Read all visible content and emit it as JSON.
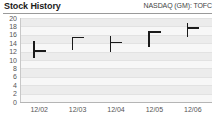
{
  "header": {
    "title": "Stock History",
    "ticker": "NASDAQ (GM): TOFC"
  },
  "chart_data": {
    "type": "ohlc",
    "title": "Stock History",
    "subtitle": "NASDAQ (GM): TOFC",
    "xlabel": "",
    "ylabel": "",
    "ylim": [
      0,
      20
    ],
    "yticks": [
      20,
      18,
      16,
      14,
      12,
      10,
      8,
      6,
      4,
      2,
      0
    ],
    "ytick_labels": [
      "20",
      "18",
      "16",
      "14",
      "12",
      "10",
      "8",
      "6",
      "4",
      "2",
      "0"
    ],
    "grid": true,
    "legend": false,
    "categories": [
      "12/02",
      "12/03",
      "12/04",
      "12/05",
      "12/06"
    ],
    "series": [
      {
        "name": "TOFC",
        "bars": [
          {
            "date": "12/02",
            "high": 14.5,
            "low": 10.5,
            "close": 12.3,
            "close_side": "right"
          },
          {
            "date": "12/03",
            "high": 15.5,
            "low": 12.3,
            "close": 15.5,
            "close_side": "right"
          },
          {
            "date": "12/04",
            "high": 15.8,
            "low": 11.8,
            "close": 14.3,
            "close_side": "right"
          },
          {
            "date": "12/05",
            "high": 16.8,
            "low": 13.0,
            "close": 16.8,
            "close_side": "right"
          },
          {
            "date": "12/06",
            "high": 18.8,
            "low": 15.5,
            "close": 17.8,
            "close_side": "right"
          }
        ]
      }
    ]
  }
}
